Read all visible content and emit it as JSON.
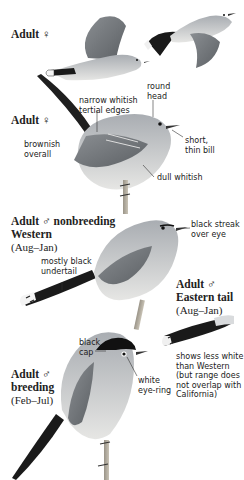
{
  "plate": {
    "colors": {
      "background": "#ffffff",
      "body_gray": "#b8bcc0",
      "belly": "#e8e8e6",
      "tail_black": "#1a1a1a",
      "cap_black": "#111111",
      "label_text": "#222222"
    },
    "figures": [
      {
        "id": "adult-female-flight",
        "title": "Adult ♀",
        "annotations": []
      },
      {
        "id": "adult-female-perched",
        "title": "Adult ♀",
        "annotations": [
          {
            "text": "round head"
          },
          {
            "text": "narrow whitish tertial edges"
          },
          {
            "text": "brownish overall"
          },
          {
            "text": "short, thin bill"
          },
          {
            "text": "dull whitish"
          }
        ]
      },
      {
        "id": "adult-male-nonbreeding-western",
        "title_line1": "Adult ♂ nonbreeding",
        "title_line2": "Western",
        "title_line3": "(Aug–Jan)",
        "annotations": [
          {
            "text": "black streak over eye"
          },
          {
            "text": "mostly black undertail"
          }
        ]
      },
      {
        "id": "adult-male-eastern-tail",
        "title_line1": "Adult ♂",
        "title_line2": "Eastern tail",
        "title_line3": "(Aug–Jan)",
        "annotations": [
          {
            "text": "shows less white than Western (but range does not overlap with California)"
          }
        ]
      },
      {
        "id": "adult-male-breeding",
        "title_line1": "Adult ♂",
        "title_line2": "breeding",
        "title_line3": "(Feb–Jul)",
        "annotations": [
          {
            "text": "black cap"
          },
          {
            "text": "white eye-ring"
          }
        ]
      }
    ]
  },
  "labels": {
    "f1_title": "Adult ♀",
    "f2_title": "Adult ♀",
    "round_head_1": "round",
    "round_head_2": "head",
    "tertial_1": "narrow whitish",
    "tertial_2": "tertial edges",
    "brownish_1": "brownish",
    "brownish_2": "overall",
    "bill_1": "short,",
    "bill_2": "thin bill",
    "dull_whitish": "dull whitish",
    "nb_title_1": "Adult ♂ nonbreeding",
    "nb_title_2": "Western",
    "nb_title_3": "(Aug–Jan)",
    "streak_1": "black streak",
    "streak_2": "over eye",
    "undertail_1": "mostly black",
    "undertail_2": "undertail",
    "east_title_1": "Adult ♂",
    "east_title_2": "Eastern tail",
    "east_title_3": "(Aug–Jan)",
    "east_note_1": "shows less white",
    "east_note_2": "than Western",
    "east_note_3": "(but range does",
    "east_note_4": "not overlap with",
    "east_note_5": "California)",
    "br_title_1": "Adult ♂",
    "br_title_2": "breeding",
    "br_title_3": "(Feb–Jul)",
    "cap_1": "black",
    "cap_2": "cap",
    "eyering_1": "white",
    "eyering_2": "eye-ring"
  }
}
